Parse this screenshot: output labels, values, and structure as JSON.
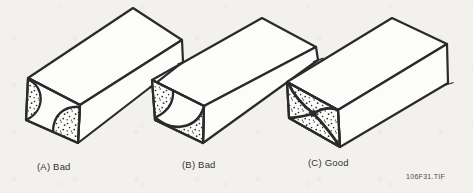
{
  "figure": {
    "caption": "106F31.TIF",
    "panels": [
      {
        "id": "A",
        "label": "(A) Bad"
      },
      {
        "id": "B",
        "label": "(B) Bad"
      },
      {
        "id": "C",
        "label": "(C) Good"
      }
    ],
    "colors": {
      "ink": "#2a2a2a",
      "paper": "#f2f1ee",
      "face": "#fcfcfb",
      "stipple_dot": "#2f2f2f"
    }
  }
}
